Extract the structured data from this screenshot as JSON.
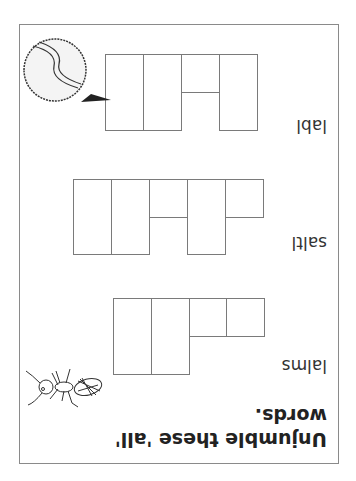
{
  "worksheet": {
    "instruction": "Unjumble these 'all' words.",
    "instruction_line1": "Unjumble these 'all'",
    "instruction_line2": "words.",
    "puzzles": [
      {
        "jumbled": "lalms",
        "answer_length": 5,
        "tall_cells": [
          0,
          1
        ],
        "short_cells": [
          2,
          3,
          4
        ]
      },
      {
        "jumbled": "saltl",
        "answer_length": 5,
        "tall_cells": [
          0,
          1,
          3
        ],
        "short_cells": [
          2,
          4
        ]
      },
      {
        "jumbled": "labl",
        "answer_length": 4,
        "tall_cells": [
          0,
          1,
          3
        ],
        "short_cells": [
          2
        ]
      }
    ],
    "illustrations": [
      "ant-icon",
      "tennis-ball-icon"
    ],
    "orientation": "rotated 180 degrees"
  }
}
